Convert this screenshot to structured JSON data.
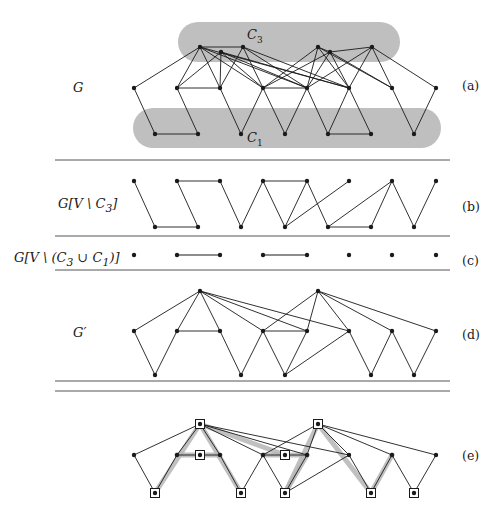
{
  "figure": {
    "background": "#ffffff",
    "ink": "#1a1a1a",
    "blob_color": "#bfbfbf",
    "highlight_color": "#b5b5b5"
  },
  "panels": [
    {
      "id": "a",
      "tag": "(a)",
      "left_label": "G",
      "tag_x": 462,
      "tag_y": 78,
      "label_x": 73,
      "label_y": 80
    },
    {
      "id": "b",
      "tag": "(b)",
      "left_label": "G[V \\ C3]",
      "tag_x": 462,
      "tag_y": 199,
      "label_x": 58,
      "label_y": 196
    },
    {
      "id": "c",
      "tag": "(c)",
      "left_label": "G[V \\ (C3 u C1)]",
      "tag_x": 462,
      "tag_y": 253,
      "label_x": 14,
      "label_y": 250
    },
    {
      "id": "d",
      "tag": "(d)",
      "left_label": "G'",
      "tag_x": 462,
      "tag_y": 327,
      "label_x": 73,
      "label_y": 325
    },
    {
      "id": "e",
      "tag": "(e)",
      "left_label": "",
      "tag_x": 462,
      "tag_y": 448,
      "label_x": 0,
      "label_y": 0
    }
  ],
  "set_labels": [
    {
      "name": "C3",
      "base": "C",
      "sub": "3",
      "x": 247,
      "y": 27
    },
    {
      "name": "C1",
      "base": "C",
      "sub": "1",
      "x": 247,
      "y": 130
    }
  ],
  "separators": [
    {
      "y": 160,
      "x1": 55,
      "x2": 450
    },
    {
      "y": 236,
      "x1": 55,
      "x2": 450
    },
    {
      "y": 270,
      "x1": 55,
      "x2": 450
    },
    {
      "y": 381,
      "x1": 55,
      "x2": 450
    },
    {
      "y": 391,
      "x1": 55,
      "x2": 450
    }
  ],
  "blobs": [
    {
      "name": "C3-blob",
      "x": 178,
      "y": 22,
      "w": 222,
      "h": 40,
      "r": 20
    },
    {
      "name": "C1-blob",
      "x": 133,
      "y": 108,
      "w": 308,
      "h": 40,
      "r": 20
    }
  ],
  "graph_a": {
    "top_nodes": [
      [
        200,
        47
      ],
      [
        221,
        52
      ],
      [
        243,
        47
      ],
      [
        318,
        47
      ],
      [
        330,
        52
      ],
      [
        372,
        47
      ]
    ],
    "middle_nodes": [
      [
        134,
        88
      ],
      [
        177,
        88
      ],
      [
        220,
        88
      ],
      [
        263,
        88
      ],
      [
        307,
        88
      ],
      [
        349,
        88
      ],
      [
        392,
        88
      ],
      [
        436,
        88
      ]
    ],
    "bottom_nodes": [
      [
        155,
        134
      ],
      [
        198,
        134
      ],
      [
        241,
        134
      ],
      [
        285,
        134
      ],
      [
        328,
        134
      ],
      [
        371,
        134
      ],
      [
        414,
        134
      ]
    ],
    "edges": [
      [
        200,
        47,
        134,
        88
      ],
      [
        200,
        47,
        177,
        88
      ],
      [
        200,
        47,
        220,
        88
      ],
      [
        200,
        47,
        263,
        88
      ],
      [
        200,
        47,
        307,
        88
      ],
      [
        200,
        47,
        349,
        88
      ],
      [
        221,
        52,
        177,
        88
      ],
      [
        221,
        52,
        220,
        88
      ],
      [
        221,
        52,
        263,
        88
      ],
      [
        221,
        52,
        307,
        88
      ],
      [
        221,
        52,
        349,
        88
      ],
      [
        243,
        47,
        220,
        88
      ],
      [
        243,
        47,
        263,
        88
      ],
      [
        243,
        47,
        307,
        88
      ],
      [
        243,
        47,
        349,
        88
      ],
      [
        318,
        47,
        263,
        88
      ],
      [
        318,
        47,
        307,
        88
      ],
      [
        318,
        47,
        349,
        88
      ],
      [
        318,
        47,
        392,
        88
      ],
      [
        330,
        52,
        263,
        88
      ],
      [
        330,
        52,
        307,
        88
      ],
      [
        330,
        52,
        349,
        88
      ],
      [
        330,
        52,
        392,
        88
      ],
      [
        372,
        47,
        307,
        88
      ],
      [
        372,
        47,
        349,
        88
      ],
      [
        372,
        47,
        392,
        88
      ],
      [
        372,
        47,
        436,
        88
      ],
      [
        200,
        47,
        243,
        47
      ],
      [
        318,
        47,
        330,
        52
      ],
      [
        330,
        52,
        372,
        47
      ],
      [
        177,
        88,
        220,
        88
      ],
      [
        263,
        88,
        307,
        88
      ],
      [
        134,
        88,
        155,
        134
      ],
      [
        155,
        134,
        198,
        134
      ],
      [
        198,
        134,
        177,
        88
      ],
      [
        220,
        88,
        241,
        134
      ],
      [
        241,
        134,
        263,
        88
      ],
      [
        263,
        88,
        285,
        134
      ],
      [
        285,
        134,
        307,
        88
      ],
      [
        307,
        88,
        328,
        134
      ],
      [
        328,
        134,
        349,
        88
      ],
      [
        328,
        134,
        371,
        134
      ],
      [
        371,
        134,
        349,
        88
      ],
      [
        392,
        88,
        414,
        134
      ],
      [
        414,
        134,
        436,
        88
      ]
    ]
  },
  "graph_b": {
    "top_nodes": [
      [
        134,
        181
      ],
      [
        177,
        181
      ],
      [
        220,
        181
      ],
      [
        263,
        181
      ],
      [
        307,
        181
      ],
      [
        349,
        181
      ],
      [
        392,
        181
      ],
      [
        436,
        181
      ]
    ],
    "bottom_nodes": [
      [
        155,
        227
      ],
      [
        198,
        227
      ],
      [
        241,
        227
      ],
      [
        285,
        227
      ],
      [
        328,
        227
      ],
      [
        371,
        227
      ],
      [
        414,
        227
      ]
    ],
    "edges": [
      [
        134,
        181,
        155,
        227
      ],
      [
        155,
        227,
        198,
        227
      ],
      [
        198,
        227,
        177,
        181
      ],
      [
        177,
        181,
        220,
        181
      ],
      [
        220,
        181,
        241,
        227
      ],
      [
        241,
        227,
        263,
        181
      ],
      [
        263,
        181,
        307,
        181
      ],
      [
        263,
        181,
        285,
        227
      ],
      [
        285,
        227,
        307,
        181
      ],
      [
        285,
        227,
        349,
        181
      ],
      [
        307,
        181,
        328,
        227
      ],
      [
        328,
        227,
        371,
        227
      ],
      [
        328,
        227,
        392,
        181
      ],
      [
        371,
        227,
        392,
        181
      ],
      [
        392,
        181,
        414,
        227
      ],
      [
        414,
        227,
        436,
        181
      ]
    ]
  },
  "graph_c": {
    "nodes": [
      [
        134,
        255
      ],
      [
        177,
        255
      ],
      [
        220,
        255
      ],
      [
        263,
        255
      ],
      [
        307,
        255
      ],
      [
        349,
        255
      ],
      [
        392,
        255
      ],
      [
        436,
        255
      ]
    ],
    "edges": [
      [
        177,
        255,
        220,
        255
      ],
      [
        263,
        255,
        307,
        255
      ]
    ]
  },
  "graph_d": {
    "top_nodes": [
      [
        200,
        291
      ],
      [
        318,
        291
      ]
    ],
    "middle_nodes": [
      [
        134,
        331
      ],
      [
        177,
        331
      ],
      [
        220,
        331
      ],
      [
        263,
        331
      ],
      [
        307,
        331
      ],
      [
        349,
        331
      ],
      [
        392,
        331
      ],
      [
        436,
        331
      ]
    ],
    "bottom_nodes": [
      [
        155,
        375
      ],
      [
        241,
        375
      ],
      [
        285,
        375
      ],
      [
        371,
        375
      ],
      [
        414,
        375
      ]
    ],
    "edges": [
      [
        200,
        291,
        134,
        331
      ],
      [
        200,
        291,
        177,
        331
      ],
      [
        200,
        291,
        220,
        331
      ],
      [
        200,
        291,
        263,
        331
      ],
      [
        200,
        291,
        307,
        331
      ],
      [
        200,
        291,
        349,
        331
      ],
      [
        318,
        291,
        263,
        331
      ],
      [
        318,
        291,
        307,
        331
      ],
      [
        318,
        291,
        349,
        331
      ],
      [
        318,
        291,
        392,
        331
      ],
      [
        318,
        291,
        436,
        331
      ],
      [
        177,
        331,
        220,
        331
      ],
      [
        263,
        331,
        307,
        331
      ],
      [
        134,
        331,
        155,
        375
      ],
      [
        155,
        375,
        177,
        331
      ],
      [
        220,
        331,
        241,
        375
      ],
      [
        241,
        375,
        263,
        331
      ],
      [
        263,
        331,
        285,
        375
      ],
      [
        285,
        375,
        307,
        331
      ],
      [
        285,
        375,
        349,
        331
      ],
      [
        349,
        331,
        371,
        375
      ],
      [
        371,
        375,
        392,
        331
      ],
      [
        392,
        331,
        414,
        375
      ],
      [
        414,
        375,
        436,
        331
      ]
    ]
  },
  "graph_e": {
    "top_nodes": [
      [
        200,
        424
      ],
      [
        318,
        424
      ]
    ],
    "middle_nodes": [
      [
        134,
        455
      ],
      [
        177,
        455
      ],
      [
        200,
        455
      ],
      [
        220,
        455
      ],
      [
        263,
        455
      ],
      [
        285,
        455
      ],
      [
        307,
        455
      ],
      [
        349,
        455
      ],
      [
        392,
        455
      ],
      [
        436,
        455
      ]
    ],
    "bottom_nodes": [
      [
        155,
        493
      ],
      [
        241,
        493
      ],
      [
        285,
        493
      ],
      [
        371,
        493
      ],
      [
        414,
        493
      ]
    ],
    "boxed_nodes": [
      [
        200,
        424
      ],
      [
        318,
        424
      ],
      [
        200,
        455
      ],
      [
        285,
        455
      ],
      [
        155,
        493
      ],
      [
        241,
        493
      ],
      [
        285,
        493
      ],
      [
        371,
        493
      ],
      [
        414,
        493
      ]
    ],
    "edges": [
      [
        200,
        424,
        134,
        455
      ],
      [
        200,
        424,
        177,
        455
      ],
      [
        200,
        424,
        220,
        455
      ],
      [
        200,
        424,
        263,
        455
      ],
      [
        200,
        424,
        307,
        455
      ],
      [
        200,
        424,
        349,
        455
      ],
      [
        318,
        424,
        263,
        455
      ],
      [
        318,
        424,
        307,
        455
      ],
      [
        318,
        424,
        349,
        455
      ],
      [
        318,
        424,
        392,
        455
      ],
      [
        318,
        424,
        436,
        455
      ],
      [
        177,
        455,
        220,
        455
      ],
      [
        263,
        455,
        307,
        455
      ],
      [
        134,
        455,
        155,
        493
      ],
      [
        155,
        493,
        177,
        455
      ],
      [
        220,
        455,
        241,
        493
      ],
      [
        241,
        493,
        263,
        455
      ],
      [
        263,
        455,
        285,
        493
      ],
      [
        285,
        493,
        307,
        455
      ],
      [
        285,
        493,
        349,
        455
      ],
      [
        349,
        455,
        371,
        493
      ],
      [
        371,
        493,
        392,
        455
      ],
      [
        392,
        455,
        414,
        493
      ],
      [
        414,
        493,
        436,
        455
      ]
    ],
    "highlighted_edges": [
      [
        177,
        455,
        200,
        455
      ],
      [
        200,
        455,
        220,
        455
      ],
      [
        263,
        455,
        285,
        455
      ],
      [
        285,
        455,
        307,
        455
      ],
      [
        200,
        424,
        155,
        493
      ],
      [
        200,
        424,
        241,
        493
      ],
      [
        200,
        424,
        285,
        455
      ],
      [
        318,
        424,
        285,
        493
      ],
      [
        318,
        424,
        371,
        493
      ],
      [
        285,
        493,
        307,
        455
      ],
      [
        371,
        493,
        392,
        455
      ]
    ]
  }
}
